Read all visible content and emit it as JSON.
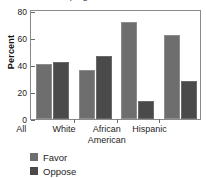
{
  "chart_data": {
    "type": "bar",
    "title": "Favor programs for minorities",
    "title_clipped": true,
    "categories": [
      "All",
      "White",
      "African American",
      "Hispanic"
    ],
    "category_lines": [
      [
        "All"
      ],
      [
        "White"
      ],
      [
        "African",
        "American"
      ],
      [
        "Hispanic"
      ]
    ],
    "series": [
      {
        "name": "Favor",
        "color": "#6e6e6e",
        "values": [
          41,
          36,
          72,
          62
        ]
      },
      {
        "name": "Oppose",
        "color": "#4a4a4a",
        "values": [
          42,
          47,
          13,
          28
        ]
      }
    ],
    "xlabel": "",
    "ylabel": "Percent",
    "ylim": [
      0,
      80
    ],
    "yticks": [
      0,
      20,
      40,
      60,
      80
    ],
    "ytick_labels": [
      "0",
      "20",
      "40",
      "60",
      "80"
    ],
    "grid": false,
    "legend_position": "bottom-left"
  },
  "axis": {
    "y_label": "Percent",
    "y_ticks": [
      "80",
      "60",
      "40",
      "20",
      "0"
    ]
  },
  "legend": {
    "items": [
      {
        "label": "Favor"
      },
      {
        "label": "Oppose"
      }
    ]
  }
}
